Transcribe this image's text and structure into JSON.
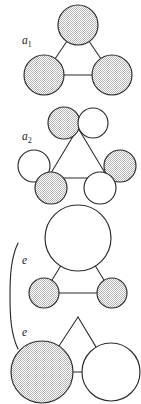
{
  "figure": {
    "caption_present": false,
    "background_color": "#ffffff",
    "stroke_color": "#2b2b2b",
    "shaded_fill_color": "#d2d2d2",
    "open_fill_color": "#ffffff"
  },
  "labels": {
    "a1_base": "a",
    "a1_sub": "1",
    "a2_base": "a",
    "a2_sub": "2",
    "e_first": "e",
    "e_second": "e"
  },
  "brace": {
    "present": true,
    "orientation": "left",
    "spans_panels": "3-4"
  },
  "chart_data": {
    "type": "diagram",
    "title": "",
    "panels": [
      {
        "id": "panel-a1",
        "label": "a1",
        "label_x": 22,
        "label_y": 44,
        "vertices": [
          {
            "name": "apex",
            "x": 78,
            "y": 25,
            "r": 20,
            "fill": "shaded"
          },
          {
            "name": "bottom-left",
            "x": 44,
            "y": 75,
            "r": 20,
            "fill": "shaded"
          },
          {
            "name": "bottom-right",
            "x": 112,
            "y": 75,
            "r": 20,
            "fill": "shaded"
          }
        ],
        "edges": [
          {
            "from": "apex",
            "to": "bottom-left"
          },
          {
            "from": "apex",
            "to": "bottom-right"
          },
          {
            "from": "bottom-left",
            "to": "bottom-right"
          }
        ],
        "satellites": []
      },
      {
        "id": "panel-a2",
        "label": "a2",
        "label_x": 22,
        "label_y": 140,
        "vertices": [
          {
            "name": "apex",
            "x": 78,
            "y": 128,
            "r": 0,
            "fill": "none"
          },
          {
            "name": "bottom-left",
            "x": 48,
            "y": 178,
            "r": 0,
            "fill": "none"
          },
          {
            "name": "bottom-right",
            "x": 108,
            "y": 178,
            "r": 0,
            "fill": "none"
          }
        ],
        "edges": [
          {
            "from": "apex",
            "to": "bottom-left"
          },
          {
            "from": "apex",
            "to": "bottom-right"
          },
          {
            "from": "bottom-left",
            "to": "bottom-right"
          }
        ],
        "satellites": [
          {
            "name": "apex-shaded",
            "x": 64,
            "y": 123,
            "r": 16,
            "fill": "shaded"
          },
          {
            "name": "apex-open",
            "x": 93,
            "y": 123,
            "r": 15,
            "fill": "open"
          },
          {
            "name": "bottom-left-open",
            "x": 34,
            "y": 166,
            "r": 16,
            "fill": "open"
          },
          {
            "name": "bottom-left-shaded",
            "x": 51,
            "y": 188,
            "r": 16,
            "fill": "shaded"
          },
          {
            "name": "bottom-right-shaded",
            "x": 120,
            "y": 166,
            "r": 16,
            "fill": "shaded"
          },
          {
            "name": "bottom-right-open",
            "x": 100,
            "y": 188,
            "r": 16,
            "fill": "open"
          }
        ]
      },
      {
        "id": "panel-e1",
        "label": "e",
        "label_x": 22,
        "label_y": 264,
        "vertices": [
          {
            "name": "apex",
            "x": 78,
            "y": 238,
            "r": 33,
            "fill": "open"
          },
          {
            "name": "bottom-left",
            "x": 44,
            "y": 293,
            "r": 15,
            "fill": "shaded"
          },
          {
            "name": "bottom-right",
            "x": 112,
            "y": 293,
            "r": 15,
            "fill": "shaded"
          }
        ],
        "edges": [
          {
            "from": "apex",
            "to": "bottom-left"
          },
          {
            "from": "apex",
            "to": "bottom-right"
          },
          {
            "from": "bottom-left",
            "to": "bottom-right"
          }
        ],
        "satellites": []
      },
      {
        "id": "panel-e2",
        "label": "e",
        "label_x": 22,
        "label_y": 336,
        "vertices": [
          {
            "name": "apex",
            "x": 78,
            "y": 317,
            "r": 0,
            "fill": "none"
          },
          {
            "name": "bottom-left",
            "x": 42,
            "y": 372,
            "r": 31,
            "fill": "shaded"
          },
          {
            "name": "bottom-right",
            "x": 111,
            "y": 372,
            "r": 29,
            "fill": "open"
          }
        ],
        "edges": [
          {
            "from": "apex",
            "to": "bottom-left"
          },
          {
            "from": "apex",
            "to": "bottom-right"
          },
          {
            "from": "bottom-left",
            "to": "bottom-right"
          }
        ],
        "satellites": []
      }
    ]
  }
}
